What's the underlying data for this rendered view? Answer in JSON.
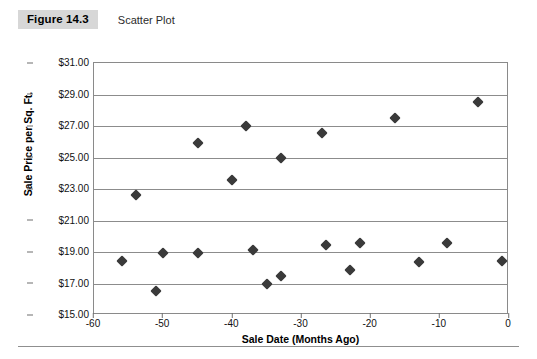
{
  "figure": {
    "number_label": "Figure 14.3",
    "caption": "Scatter Plot"
  },
  "chart_data": {
    "type": "scatter",
    "title": "Scatter Plot",
    "xlabel": "Sale Date (Months Ago)",
    "ylabel": "Sale Price per Sq. Ft.",
    "xlim": [
      -60,
      0
    ],
    "ylim": [
      15,
      31
    ],
    "xticks": [
      -60,
      -50,
      -40,
      -30,
      -20,
      -10,
      0
    ],
    "xtick_labels": [
      "-60",
      "-50",
      "-40",
      "-30",
      "-20",
      "-10",
      "0"
    ],
    "yticks": [
      15,
      17,
      19,
      21,
      23,
      25,
      27,
      29,
      31
    ],
    "ytick_labels": [
      "$15.00",
      "$17.00",
      "$19.00",
      "$21.00",
      "$23.00",
      "$25.00",
      "$27.00",
      "$29.00",
      "$31.00"
    ],
    "grid": "horizontal",
    "legend": "none",
    "marker": "diamond",
    "marker_color": "#3a3a3a",
    "points": [
      {
        "x": -56.0,
        "y": 18.4
      },
      {
        "x": -54.0,
        "y": 22.65
      },
      {
        "x": -51.0,
        "y": 16.55
      },
      {
        "x": -50.0,
        "y": 18.95
      },
      {
        "x": -45.0,
        "y": 25.9
      },
      {
        "x": -45.0,
        "y": 18.95
      },
      {
        "x": -40.0,
        "y": 23.55
      },
      {
        "x": -38.0,
        "y": 27.0
      },
      {
        "x": -37.0,
        "y": 19.15
      },
      {
        "x": -35.0,
        "y": 17.0
      },
      {
        "x": -33.0,
        "y": 17.5
      },
      {
        "x": -33.0,
        "y": 24.95
      },
      {
        "x": -27.0,
        "y": 26.55
      },
      {
        "x": -26.5,
        "y": 19.45
      },
      {
        "x": -23.0,
        "y": 17.85
      },
      {
        "x": -21.5,
        "y": 19.55
      },
      {
        "x": -16.5,
        "y": 27.5
      },
      {
        "x": -13.0,
        "y": 18.35
      },
      {
        "x": -9.0,
        "y": 19.55
      },
      {
        "x": -4.5,
        "y": 28.5
      },
      {
        "x": -1.0,
        "y": 18.4
      }
    ]
  }
}
